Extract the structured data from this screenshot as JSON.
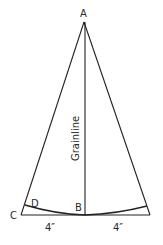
{
  "diagram": {
    "type": "pattern-wedge",
    "labels": {
      "apex": "A",
      "base_center": "B",
      "base_left": "C",
      "curve_left": "D"
    },
    "grainline_label": "Grainline",
    "measurements": {
      "left": "4″",
      "right": "4″"
    },
    "colors": {
      "stroke": "#222222",
      "background": "#ffffff"
    }
  }
}
